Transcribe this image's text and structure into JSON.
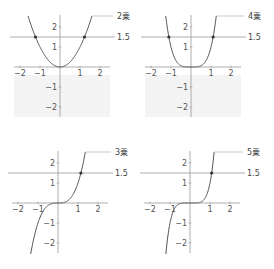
{
  "chart_data": [
    {
      "type": "line",
      "title": "2乗",
      "function": "y = x^2",
      "exponent": 2,
      "series": [
        {
          "name": "2乗",
          "x": [
            -1.6,
            -1.22,
            -1,
            -0.5,
            0,
            0.5,
            1,
            1.22,
            1.6
          ],
          "y": [
            2.56,
            1.5,
            1,
            0.25,
            0,
            0.25,
            1,
            1.5,
            2.56
          ]
        }
      ],
      "hline": {
        "y": 1.5,
        "label": "1.5"
      },
      "intersections": [
        [
          -1.22,
          1.5
        ],
        [
          1.22,
          1.5
        ]
      ],
      "xticks": [
        "-2",
        "-1",
        "1",
        "2"
      ],
      "yticks": [
        "2",
        "1",
        "-1",
        "-2"
      ],
      "xlim": [
        -2.3,
        2.5
      ],
      "ylim": [
        -2.5,
        2.6
      ],
      "curve_label": "2乗",
      "shaded_region": "below x-axis, light gray"
    },
    {
      "type": "line",
      "title": "4乗",
      "function": "y = x^4",
      "exponent": 4,
      "series": [
        {
          "name": "4乗",
          "x": [
            -1.26,
            -1.11,
            -1,
            -0.5,
            0,
            0.5,
            1,
            1.11,
            1.26
          ],
          "y": [
            2.52,
            1.5,
            1,
            0.06,
            0,
            0.06,
            1,
            1.5,
            2.52
          ]
        }
      ],
      "hline": {
        "y": 1.5,
        "label": "1.5"
      },
      "intersections": [
        [
          -1.11,
          1.5
        ],
        [
          1.11,
          1.5
        ]
      ],
      "xticks": [
        "-2",
        "-1",
        "1",
        "2"
      ],
      "yticks": [
        "2",
        "1",
        "-1",
        "-2"
      ],
      "xlim": [
        -2.3,
        2.5
      ],
      "ylim": [
        -2.5,
        2.6
      ],
      "curve_label": "4乗",
      "shaded_region": "below x-axis, light gray"
    },
    {
      "type": "line",
      "title": "3乗",
      "function": "y = x^3",
      "exponent": 3,
      "series": [
        {
          "name": "3乗",
          "x": [
            -1.36,
            -1,
            -0.5,
            0,
            0.5,
            1,
            1.14,
            1.36
          ],
          "y": [
            -2.52,
            -1,
            -0.125,
            0,
            0.125,
            1,
            1.5,
            2.52
          ]
        }
      ],
      "hline": {
        "y": 1.5,
        "label": "1.5"
      },
      "intersections": [
        [
          1.14,
          1.5
        ]
      ],
      "xticks": [
        "-2",
        "-1",
        "1",
        "2"
      ],
      "yticks": [
        "2",
        "1",
        "-1",
        "-2"
      ],
      "xlim": [
        -2.3,
        2.5
      ],
      "ylim": [
        -2.5,
        2.6
      ],
      "curve_label": "3乗"
    },
    {
      "type": "line",
      "title": "5乗",
      "function": "y = x^5",
      "exponent": 5,
      "series": [
        {
          "name": "5乗",
          "x": [
            -1.2,
            -1,
            -0.5,
            0,
            0.5,
            1,
            1.08,
            1.2
          ],
          "y": [
            -2.49,
            -1,
            -0.03,
            0,
            0.03,
            1,
            1.5,
            2.49
          ]
        }
      ],
      "hline": {
        "y": 1.5,
        "label": "1.5"
      },
      "intersections": [
        [
          1.08,
          1.5
        ]
      ],
      "xticks": [
        "-2",
        "-1",
        "1",
        "2"
      ],
      "yticks": [
        "2",
        "1",
        "-1",
        "-2"
      ],
      "xlim": [
        -2.3,
        2.5
      ],
      "ylim": [
        -2.5,
        2.6
      ],
      "curve_label": "5乗"
    }
  ],
  "panels": [
    {
      "id": "square",
      "curve_label": "2乗",
      "hline_label": "1.5",
      "exponent": 2,
      "ox": 60,
      "oy": 67
    },
    {
      "id": "fourth",
      "curve_label": "4乗",
      "hline_label": "1.5",
      "exponent": 4,
      "ox": 191,
      "oy": 67
    },
    {
      "id": "cube",
      "curve_label": "3乗",
      "hline_label": "1.5",
      "exponent": 3,
      "ox": 58,
      "oy": 203
    },
    {
      "id": "fifth",
      "curve_label": "5乗",
      "hline_label": "1.5",
      "exponent": 5,
      "ox": 190,
      "oy": 203
    }
  ],
  "axis_ticks": {
    "x": [
      -2,
      -1,
      1,
      2
    ],
    "y": [
      2,
      1,
      -1,
      -2
    ]
  },
  "hline_value": 1.5,
  "colors": {
    "curve": "#555555",
    "axis": "#999999",
    "hline": "#999999",
    "point": "#333333",
    "shade": "#f4f4f4",
    "leader": "#aaaaaa"
  }
}
